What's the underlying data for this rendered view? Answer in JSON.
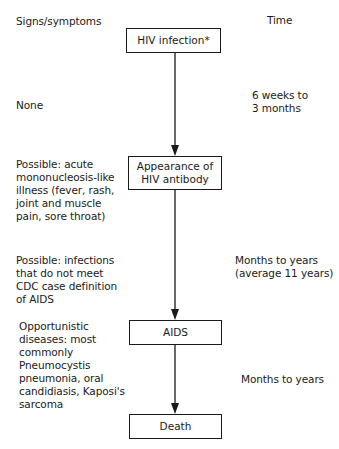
{
  "headers": {
    "left": "Signs/symptoms",
    "right": "Time"
  },
  "stages": [
    {
      "label": "HIV infection*"
    },
    {
      "label": "Appearance of\nHIV antibody"
    },
    {
      "label": "AIDS"
    },
    {
      "label": "Death"
    }
  ],
  "symptoms": [
    "None",
    "Possible: acute\nmononucleosis-like\nillness (fever, rash,\njoint and  muscle\npain, sore throat)",
    "Possible: infections\nthat do not meet\nCDC case definition\nof AIDS",
    "Opportunistic\ndiseases: most\ncommonly\nPneumocystis\npneumonia, oral\ncandidiasis, Kaposi's\nsarcoma"
  ],
  "times": [
    "6 weeks to\n3 months",
    "Months to years\n(average 11 years)",
    "Months to years"
  ]
}
